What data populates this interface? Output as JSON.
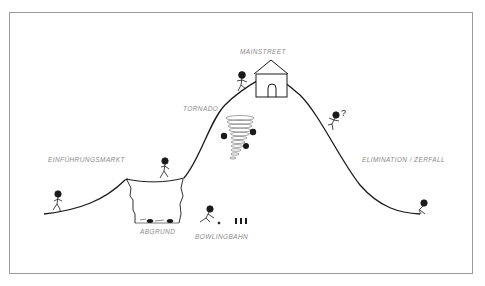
{
  "diagram": {
    "type": "hill-curve illustration (product lifecycle metaphor)",
    "labels": {
      "intro": "EINFÜHRUNGSMARKT",
      "abyss": "ABGRUND",
      "bowling": "BOWLINGBAHN",
      "tornado": "TORNADO",
      "mainstreet": "MAINSTREET",
      "decline": "ELIMINATION / ZERFALL"
    },
    "annotations": {
      "question_mark": "?"
    },
    "colors": {
      "line": "#1a1a1a",
      "label": "#8a8a8a",
      "frame": "#9a9a9a",
      "tornado": "#7a7a7a"
    }
  }
}
